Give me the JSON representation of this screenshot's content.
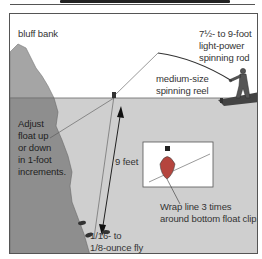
{
  "diagram": {
    "type": "fishing-rig-illustration",
    "labels": {
      "bluff_bank": "bluff bank",
      "rod_line1": "7½- to 9-foot",
      "rod_line2": "light-power",
      "rod_line3": "spinning rod",
      "reel_line1": "medium-size",
      "reel_line2": "spinning reel",
      "adjust_line1": "Adjust",
      "adjust_line2": "float up",
      "adjust_line3": "or down",
      "adjust_line4": "in 1-foot",
      "adjust_line5": "increments.",
      "depth": "9 feet",
      "fly_line1": "1/16- to",
      "fly_line2": "1/8-ounce fly",
      "wrap_line1": "Wrap line 3 times",
      "wrap_line2": "around bottom float clip."
    },
    "colors": {
      "sky": "#ffffff",
      "water": "#cfcfcf",
      "bank": "#9a9a9a",
      "bank_underwater": "#8a8a8a",
      "float_red": "#b5453e",
      "float_cap": "#222222",
      "outline": "#444444"
    }
  }
}
